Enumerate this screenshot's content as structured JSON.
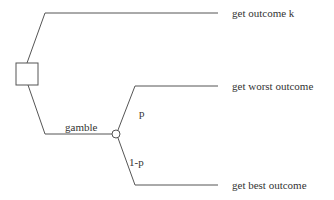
{
  "diagram": {
    "type": "decision-tree",
    "decision_node": {
      "shape": "square"
    },
    "branches": {
      "sure_thing": {
        "outcome": "get outcome  k"
      },
      "gamble": {
        "label": "gamble",
        "chance_node": {
          "shape": "circle"
        },
        "outcomes": [
          {
            "probability": "p",
            "outcome": "get worst outcome"
          },
          {
            "probability": "1-p",
            "outcome": "get best outcome"
          }
        ]
      }
    },
    "colors": {
      "line": "#555555",
      "text": "#333333",
      "background": "#ffffff"
    }
  }
}
